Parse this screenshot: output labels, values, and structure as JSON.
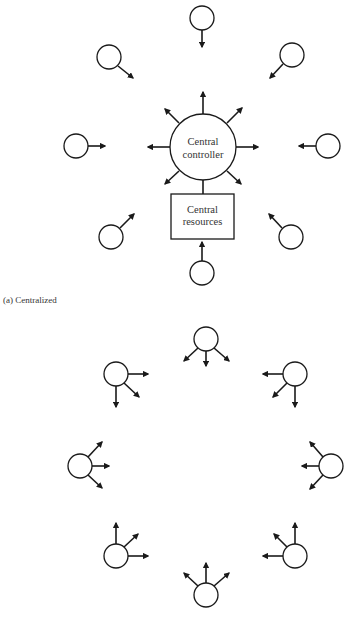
{
  "figure": {
    "centralized": {
      "caption": "(a) Centralized",
      "controller": {
        "line1": "Central",
        "line2": "controller",
        "cx": 203,
        "cy": 147,
        "r": 33
      },
      "resources": {
        "line1": "Central",
        "line2": "resources",
        "x": 171,
        "y": 194,
        "w": 63,
        "h": 45
      },
      "nodes": [
        {
          "name": "top",
          "cx": 202,
          "cy": 18,
          "arrow": [
            202,
            30,
            202,
            47
          ]
        },
        {
          "name": "upper-left",
          "cx": 109,
          "cy": 57,
          "arrow": [
            118,
            66,
            133,
            78
          ]
        },
        {
          "name": "upper-right",
          "cx": 292,
          "cy": 55,
          "arrow": [
            283,
            64,
            270,
            78
          ]
        },
        {
          "name": "left",
          "cx": 76,
          "cy": 146,
          "arrow": [
            88,
            146,
            105,
            146
          ]
        },
        {
          "name": "right",
          "cx": 328,
          "cy": 146,
          "arrow": [
            316,
            146,
            299,
            146
          ]
        },
        {
          "name": "lower-left",
          "cx": 111,
          "cy": 237,
          "arrow": [
            120,
            228,
            134,
            214
          ]
        },
        {
          "name": "lower-right",
          "cx": 291,
          "cy": 237,
          "arrow": [
            282,
            228,
            269,
            214
          ]
        },
        {
          "name": "bottom",
          "cx": 202,
          "cy": 273,
          "arrow": [
            202,
            261,
            202,
            242
          ]
        }
      ],
      "controller_arrows": [
        [
          203,
          114,
          203,
          92
        ],
        [
          227,
          123,
          242,
          108
        ],
        [
          236,
          147,
          258,
          147
        ],
        [
          227,
          171,
          241,
          184
        ],
        [
          179,
          171,
          165,
          184
        ],
        [
          170,
          147,
          148,
          147
        ],
        [
          179,
          123,
          165,
          109
        ]
      ],
      "controller_to_resources": [
        203,
        180,
        203,
        194
      ]
    },
    "distributed": {
      "caption": "",
      "nodes": [
        {
          "name": "top",
          "cx": 206,
          "cy": 339,
          "arrows": [
            [
              206,
              351,
              206,
              366
            ],
            [
              198,
              348,
              184,
              361
            ],
            [
              214,
              348,
              229,
              361
            ]
          ]
        },
        {
          "name": "upper-left",
          "cx": 116,
          "cy": 374,
          "arrows": [
            [
              128,
              374,
              148,
              374
            ],
            [
              116,
              386,
              116,
              407
            ],
            [
              124,
              383,
              139,
              397
            ]
          ]
        },
        {
          "name": "upper-right",
          "cx": 295,
          "cy": 374,
          "arrows": [
            [
              283,
              374,
              263,
              374
            ],
            [
              295,
              386,
              295,
              407
            ],
            [
              287,
              383,
              273,
              397
            ]
          ]
        },
        {
          "name": "left",
          "cx": 80,
          "cy": 466,
          "arrows": [
            [
              92,
              466,
              109,
              466
            ],
            [
              88,
              457,
              102,
              442
            ],
            [
              88,
              475,
              102,
              488
            ]
          ]
        },
        {
          "name": "right",
          "cx": 331,
          "cy": 466,
          "arrows": [
            [
              319,
              466,
              302,
              466
            ],
            [
              323,
              457,
              310,
              442
            ],
            [
              323,
              475,
              310,
              489
            ]
          ]
        },
        {
          "name": "lower-left",
          "cx": 116,
          "cy": 556,
          "arrows": [
            [
              116,
              544,
              116,
              523
            ],
            [
              124,
              547,
              138,
              534
            ],
            [
              128,
              556,
              148,
              556
            ]
          ]
        },
        {
          "name": "lower-right",
          "cx": 295,
          "cy": 556,
          "arrows": [
            [
              295,
              544,
              295,
              523
            ],
            [
              287,
              547,
              274,
              534
            ],
            [
              283,
              556,
              263,
              556
            ]
          ]
        },
        {
          "name": "bottom",
          "cx": 206,
          "cy": 595,
          "arrows": [
            [
              206,
              583,
              206,
              563
            ],
            [
              198,
              586,
              184,
              573
            ],
            [
              214,
              586,
              229,
              573
            ]
          ]
        }
      ]
    },
    "node_radius": 12,
    "stroke_color": "#1a1a1a"
  }
}
